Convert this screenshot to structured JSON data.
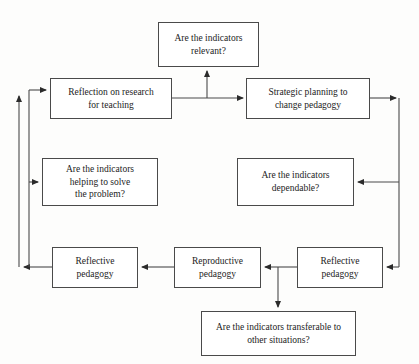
{
  "diagram": {
    "type": "flowchart",
    "background_color": "#fdfdfc",
    "line_color": "#4a4a4a",
    "text_color": "#1c1c1c",
    "nodes": [
      {
        "id": "indicators-relevant",
        "label": "Are the indicators\nrelevant?",
        "x": 158,
        "y": 22,
        "w": 101,
        "h": 45
      },
      {
        "id": "reflection-on-research",
        "label": "Reflection on research\nfor teaching",
        "x": 50,
        "y": 78,
        "w": 122,
        "h": 41
      },
      {
        "id": "strategic-planning",
        "label": "Strategic planning to\nchange pedagogy",
        "x": 246,
        "y": 78,
        "w": 124,
        "h": 41
      },
      {
        "id": "indicators-helping",
        "label": "Are the indicators\nhelping to solve\nthe problem?",
        "x": 42,
        "y": 158,
        "w": 116,
        "h": 48
      },
      {
        "id": "indicators-dependable",
        "label": "Are the indicators\ndependable?",
        "x": 237,
        "y": 158,
        "w": 117,
        "h": 48
      },
      {
        "id": "reflective-pedagogy-left",
        "label": "Reflective\npedagogy",
        "x": 52,
        "y": 247,
        "w": 86,
        "h": 41
      },
      {
        "id": "reproductive-pedagogy",
        "label": "Reproductive\npedagogy",
        "x": 174,
        "y": 247,
        "w": 87,
        "h": 41
      },
      {
        "id": "reflective-pedagogy-right",
        "label": "Reflective\npedagogy",
        "x": 297,
        "y": 247,
        "w": 86,
        "h": 41
      },
      {
        "id": "indicators-transferable",
        "label": "Are the indicators transferable to\nother situations?",
        "x": 201,
        "y": 311,
        "w": 155,
        "h": 45
      }
    ],
    "edges": [
      {
        "id": "reflection-to-strategic",
        "from": "reflection-on-research",
        "to": "strategic-planning",
        "direction": "right"
      },
      {
        "id": "branch-to-relevant",
        "from": "reflection-to-strategic",
        "to": "indicators-relevant",
        "direction": "up"
      },
      {
        "id": "strategic-to-right-rail",
        "from": "strategic-planning",
        "to": "right-rail",
        "direction": "right"
      },
      {
        "id": "right-rail-to-dependable",
        "from": "right-rail",
        "to": "indicators-dependable",
        "direction": "left"
      },
      {
        "id": "right-rail-to-reflective-right",
        "from": "right-rail",
        "to": "reflective-pedagogy-right",
        "direction": "left"
      },
      {
        "id": "reflective-right-to-reproductive",
        "from": "reflective-pedagogy-right",
        "to": "reproductive-pedagogy",
        "direction": "left"
      },
      {
        "id": "branch-to-transferable",
        "from": "reflective-right-to-reproductive",
        "to": "indicators-transferable",
        "direction": "down"
      },
      {
        "id": "reproductive-to-reflective-left",
        "from": "reproductive-pedagogy",
        "to": "reflective-pedagogy-left",
        "direction": "left"
      },
      {
        "id": "reflective-left-to-outer-rail",
        "from": "reflective-pedagogy-left",
        "to": "outer-left-rail",
        "direction": "left"
      },
      {
        "id": "outer-rail-to-reflection",
        "from": "outer-left-rail",
        "to": "reflection-on-research",
        "direction": "up-right"
      },
      {
        "id": "inner-rail-to-helping",
        "from": "inner-left-rail",
        "to": "indicators-helping",
        "direction": "right"
      }
    ]
  }
}
